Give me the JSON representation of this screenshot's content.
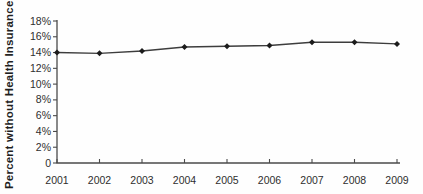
{
  "chart_data": {
    "type": "line",
    "title": "",
    "xlabel": "",
    "ylabel": "Percent without Health Insurance",
    "categories": [
      "2001",
      "2002",
      "2003",
      "2004",
      "2005",
      "2006",
      "2007",
      "2008",
      "2009"
    ],
    "series": [
      {
        "name": "Percent without health insurance",
        "values": [
          14.0,
          13.9,
          14.2,
          14.7,
          14.8,
          14.9,
          15.3,
          15.3,
          15.1
        ]
      }
    ],
    "y_tick_labels": [
      "18%",
      "16%",
      "14%",
      "12%",
      "10%",
      "8%",
      "6%",
      "4%",
      "2%",
      "0"
    ],
    "y_tick_values": [
      18,
      16,
      14,
      12,
      10,
      8,
      6,
      4,
      2,
      0
    ],
    "ylim": [
      0,
      18
    ],
    "grid": false,
    "legend": "none",
    "marker": "diamond",
    "colors": {
      "line": "#3d3d3d",
      "marker": "#1c1c1c",
      "axis": "#4a4a4a",
      "tick_label": "#2e2e2e"
    }
  }
}
